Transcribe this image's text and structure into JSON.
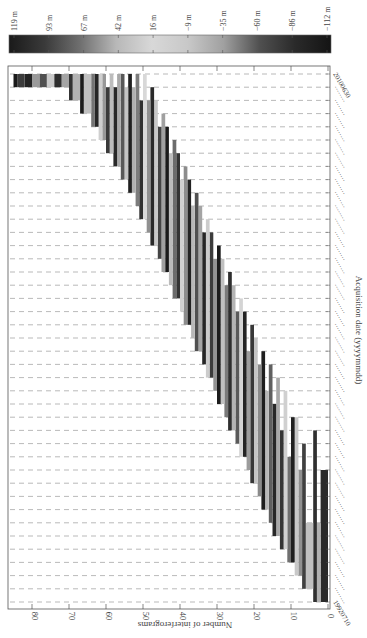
{
  "chart_data": {
    "type": "bar",
    "subtype": "interferogram-baseline-network (rotated 90deg)",
    "orientation_note": "Figure is rotated: acquisition dates run bottom-to-top along the right edge; interferogram count runs right-to-left along the bottom.",
    "title": "",
    "xlabel": "Acquisition date (yyyymmdd)",
    "ylabel": "Number of interferograms",
    "ylim": [
      0,
      85
    ],
    "yticks": [
      0,
      10,
      20,
      30,
      40,
      50,
      60,
      70,
      80
    ],
    "date_range": {
      "first": "19920710",
      "last": "20100630"
    },
    "n_dates": 40,
    "grid": {
      "style": "dashed",
      "direction": "per-acquisition-date"
    },
    "colorbar": {
      "label": "Perpendicular baseline",
      "ticks": [
        "119 m",
        "93 m",
        "67 m",
        "42 m",
        "16 m",
        "−9 m",
        "−35 m",
        "−60 m",
        "−86 m",
        "−112 m"
      ],
      "values": [
        119,
        93,
        67,
        42,
        16,
        -9,
        -35,
        -60,
        -86,
        -112
      ],
      "colormap": [
        "#1a1a1a",
        "#3a3a3a",
        "#707070",
        "#b8b8b8",
        "#d8d8d8",
        "#c8c8c8",
        "#a0a0a0",
        "#505050",
        "#2a2a2a",
        "#141414"
      ]
    },
    "bars": [
      {
        "idx": 0,
        "start_date": 0,
        "end_date": 10,
        "count_lo": 0,
        "count_hi": 2,
        "shade": "#2a2a2a"
      },
      {
        "idx": 1,
        "start_date": 0,
        "end_date": 6,
        "count_lo": 2,
        "count_hi": 3,
        "shade": "#b0b0b0"
      },
      {
        "idx": 2,
        "start_date": 0,
        "end_date": 13,
        "count_lo": 3,
        "count_hi": 4,
        "shade": "#303030"
      },
      {
        "idx": 3,
        "start_date": 1,
        "end_date": 6,
        "count_lo": 4,
        "count_hi": 6,
        "shade": "#c0c0c0"
      },
      {
        "idx": 4,
        "start_date": 1,
        "end_date": 12,
        "count_lo": 6,
        "count_hi": 7,
        "shade": "#404040"
      },
      {
        "idx": 5,
        "start_date": 2,
        "end_date": 10,
        "count_lo": 7,
        "count_hi": 8,
        "shade": "#909090"
      },
      {
        "idx": 6,
        "start_date": 2,
        "end_date": 14,
        "count_lo": 8,
        "count_hi": 9,
        "shade": "#c8c8c8"
      },
      {
        "idx": 7,
        "start_date": 3,
        "end_date": 14,
        "count_lo": 9,
        "count_hi": 10,
        "shade": "#202020"
      },
      {
        "idx": 8,
        "start_date": 3,
        "end_date": 11,
        "count_lo": 10,
        "count_hi": 11,
        "shade": "#707070"
      },
      {
        "idx": 9,
        "start_date": 4,
        "end_date": 16,
        "count_lo": 11,
        "count_hi": 12,
        "shade": "#d0d0d0"
      },
      {
        "idx": 10,
        "start_date": 4,
        "end_date": 13,
        "count_lo": 12,
        "count_hi": 13,
        "shade": "#353535"
      },
      {
        "idx": 11,
        "start_date": 5,
        "end_date": 17,
        "count_lo": 13,
        "count_hi": 14,
        "shade": "#a8a8a8"
      },
      {
        "idx": 12,
        "start_date": 5,
        "end_date": 15,
        "count_lo": 14,
        "count_hi": 15,
        "shade": "#282828"
      },
      {
        "idx": 13,
        "start_date": 6,
        "end_date": 18,
        "count_lo": 15,
        "count_hi": 16,
        "shade": "#606060"
      },
      {
        "idx": 14,
        "start_date": 7,
        "end_date": 16,
        "count_lo": 16,
        "count_hi": 17,
        "shade": "#b8b8b8"
      },
      {
        "idx": 15,
        "start_date": 7,
        "end_date": 19,
        "count_lo": 17,
        "count_hi": 18,
        "shade": "#1e1e1e"
      },
      {
        "idx": 16,
        "start_date": 8,
        "end_date": 18,
        "count_lo": 18,
        "count_hi": 19,
        "shade": "#8a8a8a"
      },
      {
        "idx": 17,
        "start_date": 9,
        "end_date": 20,
        "count_lo": 19,
        "count_hi": 20,
        "shade": "#c4c4c4"
      },
      {
        "idx": 18,
        "start_date": 9,
        "end_date": 21,
        "count_lo": 20,
        "count_hi": 21,
        "shade": "#383838"
      },
      {
        "idx": 19,
        "start_date": 10,
        "end_date": 19,
        "count_lo": 21,
        "count_hi": 22,
        "shade": "#9c9c9c"
      },
      {
        "idx": 20,
        "start_date": 11,
        "end_date": 22,
        "count_lo": 22,
        "count_hi": 23,
        "shade": "#242424"
      },
      {
        "idx": 21,
        "start_date": 11,
        "end_date": 23,
        "count_lo": 23,
        "count_hi": 24,
        "shade": "#d4d4d4"
      },
      {
        "idx": 22,
        "start_date": 12,
        "end_date": 22,
        "count_lo": 24,
        "count_hi": 25,
        "shade": "#5a5a5a"
      },
      {
        "idx": 23,
        "start_date": 13,
        "end_date": 24,
        "count_lo": 25,
        "count_hi": 26,
        "shade": "#b4b4b4"
      },
      {
        "idx": 24,
        "start_date": 13,
        "end_date": 25,
        "count_lo": 26,
        "count_hi": 27,
        "shade": "#2e2e2e"
      },
      {
        "idx": 25,
        "start_date": 14,
        "end_date": 24,
        "count_lo": 27,
        "count_hi": 28,
        "shade": "#7a7a7a"
      },
      {
        "idx": 26,
        "start_date": 15,
        "end_date": 26,
        "count_lo": 28,
        "count_hi": 29,
        "shade": "#c0c0c0"
      },
      {
        "idx": 27,
        "start_date": 15,
        "end_date": 27,
        "count_lo": 29,
        "count_hi": 30,
        "shade": "#1c1c1c"
      },
      {
        "idx": 28,
        "start_date": 16,
        "end_date": 26,
        "count_lo": 30,
        "count_hi": 31,
        "shade": "#949494"
      },
      {
        "idx": 29,
        "start_date": 17,
        "end_date": 28,
        "count_lo": 31,
        "count_hi": 32,
        "shade": "#3c3c3c"
      },
      {
        "idx": 30,
        "start_date": 17,
        "end_date": 29,
        "count_lo": 32,
        "count_hi": 33,
        "shade": "#cccccc"
      },
      {
        "idx": 31,
        "start_date": 18,
        "end_date": 28,
        "count_lo": 33,
        "count_hi": 34,
        "shade": "#262626"
      },
      {
        "idx": 32,
        "start_date": 19,
        "end_date": 30,
        "count_lo": 34,
        "count_hi": 35,
        "shade": "#a4a4a4"
      },
      {
        "idx": 33,
        "start_date": 19,
        "end_date": 31,
        "count_lo": 35,
        "count_hi": 36,
        "shade": "#505050"
      },
      {
        "idx": 34,
        "start_date": 20,
        "end_date": 30,
        "count_lo": 36,
        "count_hi": 37,
        "shade": "#b8b8b8"
      },
      {
        "idx": 35,
        "start_date": 21,
        "end_date": 32,
        "count_lo": 37,
        "count_hi": 38,
        "shade": "#222222"
      },
      {
        "idx": 36,
        "start_date": 21,
        "end_date": 33,
        "count_lo": 38,
        "count_hi": 39,
        "shade": "#8c8c8c"
      },
      {
        "idx": 37,
        "start_date": 22,
        "end_date": 32,
        "count_lo": 39,
        "count_hi": 40,
        "shade": "#d0d0d0"
      },
      {
        "idx": 38,
        "start_date": 23,
        "end_date": 34,
        "count_lo": 40,
        "count_hi": 41,
        "shade": "#343434"
      },
      {
        "idx": 39,
        "start_date": 23,
        "end_date": 35,
        "count_lo": 41,
        "count_hi": 42,
        "shade": "#6c6c6c"
      },
      {
        "idx": 40,
        "start_date": 24,
        "end_date": 34,
        "count_lo": 42,
        "count_hi": 43,
        "shade": "#bcbcbc"
      },
      {
        "idx": 41,
        "start_date": 25,
        "end_date": 36,
        "count_lo": 43,
        "count_hi": 44,
        "shade": "#1a1a1a"
      },
      {
        "idx": 42,
        "start_date": 25,
        "end_date": 37,
        "count_lo": 44,
        "count_hi": 45,
        "shade": "#a0a0a0"
      },
      {
        "idx": 43,
        "start_date": 26,
        "end_date": 36,
        "count_lo": 45,
        "count_hi": 46,
        "shade": "#444444"
      },
      {
        "idx": 44,
        "start_date": 27,
        "end_date": 38,
        "count_lo": 46,
        "count_hi": 47,
        "shade": "#c8c8c8"
      },
      {
        "idx": 45,
        "start_date": 27,
        "end_date": 39,
        "count_lo": 47,
        "count_hi": 48,
        "shade": "#2a2a2a"
      },
      {
        "idx": 46,
        "start_date": 28,
        "end_date": 38,
        "count_lo": 48,
        "count_hi": 49,
        "shade": "#909090"
      },
      {
        "idx": 47,
        "start_date": 29,
        "end_date": 40,
        "count_lo": 49,
        "count_hi": 50,
        "shade": "#d8d8d8"
      },
      {
        "idx": 48,
        "start_date": 29,
        "end_date": 38,
        "count_lo": 50,
        "count_hi": 51,
        "shade": "#303030"
      },
      {
        "idx": 49,
        "start_date": 30,
        "end_date": 40,
        "count_lo": 51,
        "count_hi": 52,
        "shade": "#7c7c7c"
      },
      {
        "idx": 50,
        "start_date": 31,
        "end_date": 39,
        "count_lo": 52,
        "count_hi": 53,
        "shade": "#b0b0b0"
      },
      {
        "idx": 51,
        "start_date": 31,
        "end_date": 40,
        "count_lo": 53,
        "count_hi": 54,
        "shade": "#202020"
      },
      {
        "idx": 52,
        "start_date": 32,
        "end_date": 39,
        "count_lo": 54,
        "count_hi": 55,
        "shade": "#c4c4c4"
      },
      {
        "idx": 53,
        "start_date": 32,
        "end_date": 40,
        "count_lo": 55,
        "count_hi": 56,
        "shade": "#585858"
      },
      {
        "idx": 54,
        "start_date": 33,
        "end_date": 40,
        "count_lo": 56,
        "count_hi": 57,
        "shade": "#a8a8a8"
      },
      {
        "idx": 55,
        "start_date": 33,
        "end_date": 39,
        "count_lo": 57,
        "count_hi": 58,
        "shade": "#282828"
      },
      {
        "idx": 56,
        "start_date": 34,
        "end_date": 40,
        "count_lo": 58,
        "count_hi": 59,
        "shade": "#bcbcbc"
      },
      {
        "idx": 57,
        "start_date": 34,
        "end_date": 39,
        "count_lo": 59,
        "count_hi": 60,
        "shade": "#3a3a3a"
      },
      {
        "idx": 58,
        "start_date": 35,
        "end_date": 40,
        "count_lo": 60,
        "count_hi": 61,
        "shade": "#989898"
      },
      {
        "idx": 59,
        "start_date": 35,
        "end_date": 40,
        "count_lo": 61,
        "count_hi": 62,
        "shade": "#cfcfcf"
      },
      {
        "idx": 60,
        "start_date": 36,
        "end_date": 40,
        "count_lo": 62,
        "count_hi": 63,
        "shade": "#262626"
      },
      {
        "idx": 61,
        "start_date": 36,
        "end_date": 40,
        "count_lo": 63,
        "count_hi": 64,
        "shade": "#747474"
      },
      {
        "idx": 62,
        "start_date": 37,
        "end_date": 40,
        "count_lo": 64,
        "count_hi": 66,
        "shade": "#c0c0c0"
      },
      {
        "idx": 63,
        "start_date": 37,
        "end_date": 40,
        "count_lo": 66,
        "count_hi": 67,
        "shade": "#1c1c1c"
      },
      {
        "idx": 64,
        "start_date": 38,
        "end_date": 40,
        "count_lo": 67,
        "count_hi": 69,
        "shade": "#b4b4b4"
      },
      {
        "idx": 65,
        "start_date": 38,
        "end_date": 40,
        "count_lo": 69,
        "count_hi": 70,
        "shade": "#343434"
      },
      {
        "idx": 66,
        "start_date": 39,
        "end_date": 40,
        "count_lo": 70,
        "count_hi": 72,
        "shade": "#a4a4a4"
      },
      {
        "idx": 67,
        "start_date": 39,
        "end_date": 40,
        "count_lo": 72,
        "count_hi": 74,
        "shade": "#2e2e2e"
      },
      {
        "idx": 68,
        "start_date": 39,
        "end_date": 40,
        "count_lo": 74,
        "count_hi": 76,
        "shade": "#cacaca"
      },
      {
        "idx": 69,
        "start_date": 39,
        "end_date": 40,
        "count_lo": 76,
        "count_hi": 78,
        "shade": "#505050"
      },
      {
        "idx": 70,
        "start_date": 39,
        "end_date": 40,
        "count_lo": 78,
        "count_hi": 80,
        "shade": "#9a9a9a"
      },
      {
        "idx": 71,
        "start_date": 39,
        "end_date": 40,
        "count_lo": 80,
        "count_hi": 82,
        "shade": "#242424"
      },
      {
        "idx": 72,
        "start_date": 39,
        "end_date": 40,
        "count_lo": 82,
        "count_hi": 84,
        "shade": "#3c3c3c"
      },
      {
        "idx": 73,
        "start_date": 39,
        "end_date": 40,
        "count_lo": 84,
        "count_hi": 85,
        "shade": "#1a1a1a"
      }
    ]
  },
  "labels": {
    "xlabel": "Acquisition date (yyyymmdd)",
    "ylabel": "Number of interferograms",
    "first_date": "19920710",
    "last_date": "20100630"
  }
}
